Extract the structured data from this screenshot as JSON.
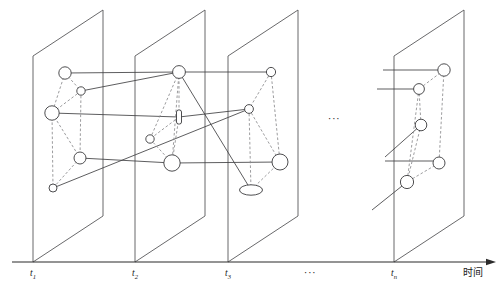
{
  "figure": {
    "axis": {
      "caption": "时间",
      "caption_icon": "arrow-right-icon",
      "line_color": "#2b2b2b",
      "y": 262,
      "x_start": 12,
      "x_end": 487,
      "ticks": [
        {
          "id": "t1",
          "base": "t",
          "sub": "1",
          "x": 33
        },
        {
          "id": "t2",
          "base": "t",
          "sub": "2",
          "x": 135
        },
        {
          "id": "t3",
          "base": "t",
          "sub": "3",
          "x": 228
        },
        {
          "id": "tn",
          "base": "t",
          "sub": "n",
          "x": 394
        }
      ],
      "tick_label_y": 276,
      "gap_marker": {
        "text": "···",
        "x": 310,
        "y": 276
      }
    },
    "mid_ellipsis": {
      "text": "···",
      "x": 334,
      "y": 122
    },
    "plane_geometry": {
      "note": "parallelogram: bottom-left at tick x on axis, skewed up-right",
      "dx": 70,
      "dy": -46,
      "height": 206,
      "stroke": "#58585a"
    },
    "planes": [
      {
        "id": "plane-t1",
        "label": "t1",
        "origin_x": 33,
        "nodes": [
          {
            "id": "t1-n1",
            "shape": "circle",
            "cx": 65,
            "cy": 73,
            "r": 6.2
          },
          {
            "id": "t1-n2",
            "shape": "circle",
            "cx": 81,
            "cy": 91,
            "r": 4.2
          },
          {
            "id": "t1-n3",
            "shape": "circle",
            "cx": 52,
            "cy": 113,
            "r": 7.2
          },
          {
            "id": "t1-n4",
            "shape": "circle",
            "cx": 80,
            "cy": 158,
            "r": 6.0
          },
          {
            "id": "t1-n5",
            "shape": "circle",
            "cx": 53,
            "cy": 188,
            "r": 4.0
          }
        ],
        "intra_edges": [
          [
            "t1-n1",
            "t1-n2"
          ],
          [
            "t1-n1",
            "t1-n3"
          ],
          [
            "t1-n2",
            "t1-n3"
          ],
          [
            "t1-n2",
            "t1-n4"
          ],
          [
            "t1-n3",
            "t1-n4"
          ],
          [
            "t1-n3",
            "t1-n5"
          ],
          [
            "t1-n4",
            "t1-n5"
          ]
        ]
      },
      {
        "id": "plane-t2",
        "label": "t2",
        "origin_x": 135,
        "nodes": [
          {
            "id": "t2-n1",
            "shape": "circle",
            "cx": 179,
            "cy": 72,
            "r": 6.4
          },
          {
            "id": "t2-n2",
            "shape": "rect",
            "cx": 179,
            "cy": 117,
            "rw": 5.0,
            "rh": 14.0,
            "rr": 2.0
          },
          {
            "id": "t2-n3",
            "shape": "circle",
            "cx": 150,
            "cy": 139,
            "r": 4.2
          },
          {
            "id": "t2-n4",
            "shape": "circle",
            "cx": 172,
            "cy": 163,
            "r": 8.2
          }
        ],
        "intra_edges": [
          [
            "t2-n1",
            "t2-n2"
          ],
          [
            "t2-n1",
            "t2-n3"
          ],
          [
            "t2-n1",
            "t2-n4"
          ],
          [
            "t2-n2",
            "t2-n3"
          ],
          [
            "t2-n2",
            "t2-n4"
          ],
          [
            "t2-n3",
            "t2-n4"
          ]
        ]
      },
      {
        "id": "plane-t3",
        "label": "t3",
        "origin_x": 228,
        "nodes": [
          {
            "id": "t3-n1",
            "shape": "circle",
            "cx": 271,
            "cy": 72,
            "r": 4.6
          },
          {
            "id": "t3-n2",
            "shape": "circle",
            "cx": 249,
            "cy": 109,
            "r": 4.4
          },
          {
            "id": "t3-n3",
            "shape": "circle",
            "cx": 280,
            "cy": 162,
            "r": 8.0
          },
          {
            "id": "t3-n4",
            "shape": "ellipse",
            "cx": 251,
            "cy": 190,
            "rx": 11.5,
            "ry": 5.2
          }
        ],
        "intra_edges": [
          [
            "t3-n1",
            "t3-n2"
          ],
          [
            "t3-n1",
            "t3-n3"
          ],
          [
            "t3-n2",
            "t3-n3"
          ],
          [
            "t3-n2",
            "t3-n4"
          ],
          [
            "t3-n3",
            "t3-n4"
          ]
        ]
      },
      {
        "id": "plane-tn",
        "label": "tn",
        "origin_x": 394,
        "nodes": [
          {
            "id": "tn-n1",
            "shape": "circle",
            "cx": 444,
            "cy": 70,
            "r": 6.2
          },
          {
            "id": "tn-n2",
            "shape": "circle",
            "cx": 419,
            "cy": 89,
            "r": 5.4
          },
          {
            "id": "tn-n3",
            "shape": "circle",
            "cx": 421,
            "cy": 125,
            "r": 5.8
          },
          {
            "id": "tn-n4",
            "schape": "circle",
            "shape": "circle",
            "cx": 439,
            "cy": 163,
            "r": 6.0
          },
          {
            "id": "tn-n5",
            "shape": "circle",
            "cx": 407,
            "cy": 182,
            "r": 6.6
          }
        ],
        "intra_edges": [
          [
            "tn-n1",
            "tn-n2"
          ],
          [
            "tn-n1",
            "tn-n4"
          ],
          [
            "tn-n2",
            "tn-n3"
          ],
          [
            "tn-n2",
            "tn-n5"
          ],
          [
            "tn-n3",
            "tn-n5"
          ],
          [
            "tn-n4",
            "tn-n5"
          ]
        ]
      }
    ],
    "inter_edges": [
      {
        "from": "t1-n1",
        "to": "t2-n1"
      },
      {
        "from": "t1-n2",
        "to": "t2-n1"
      },
      {
        "from": "t1-n3",
        "to": "t2-n2"
      },
      {
        "from": "t1-n4",
        "to": "t2-n4"
      },
      {
        "from": "t1-n5",
        "to": "t3-n2"
      },
      {
        "from": "t2-n1",
        "to": "t3-n1"
      },
      {
        "from": "t2-n2",
        "to": "t3-n2"
      },
      {
        "from": "t2-n4",
        "to": "t3-n3"
      },
      {
        "from": "t2-n1",
        "to": "t3-n4"
      }
    ],
    "truncated_edges": [
      {
        "id": "trunc-tn-1",
        "x1": 383,
        "y1": 70,
        "x2": 444,
        "y2": 70
      },
      {
        "id": "trunc-tn-2",
        "x1": 377,
        "y1": 89,
        "x2": 419,
        "y2": 89
      },
      {
        "id": "trunc-tn-3",
        "x1": 385,
        "y1": 161,
        "x2": 439,
        "y2": 161
      },
      {
        "id": "trunc-tn-4",
        "x1": 385,
        "y1": 157,
        "x2": 421,
        "y2": 125
      },
      {
        "id": "trunc-tn-5",
        "x1": 372,
        "y1": 210,
        "x2": 407,
        "y2": 182
      }
    ]
  }
}
